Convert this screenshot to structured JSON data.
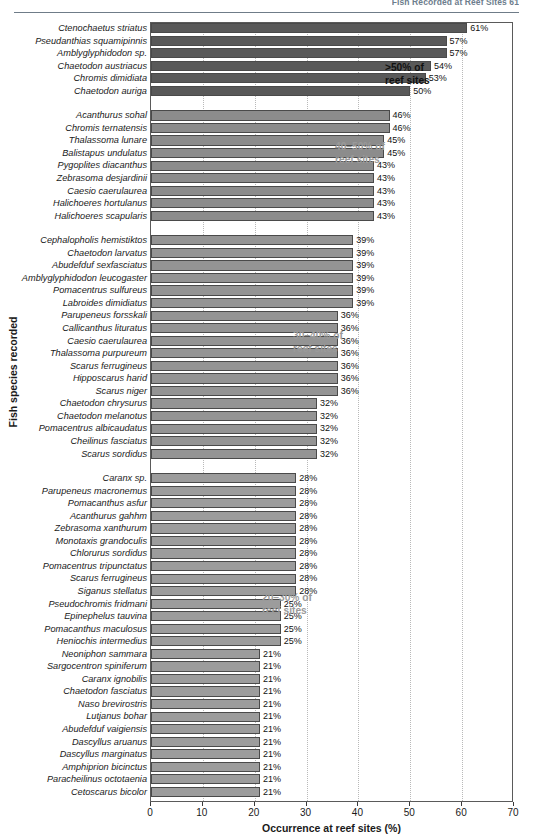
{
  "page": {
    "running_head": "Fish Recorded at Reef Sites   61"
  },
  "chart_data": {
    "type": "bar",
    "orientation": "horizontal",
    "title": "",
    "xlabel": "Occurrence at reef sites (%)",
    "ylabel": "Fish species recorded",
    "xlim": [
      0,
      70
    ],
    "xticks": [
      0,
      10,
      20,
      30,
      40,
      50,
      60,
      70
    ],
    "grid": "vertical-dotted",
    "legend": "none",
    "value_suffix": "%",
    "groups": [
      {
        "note": ">50% of\nreef sites",
        "note_line1": ">50% of",
        "note_line2": "reef sites",
        "note_color": "#111111",
        "bar_color": "#595959",
        "categories": [
          "Ctenochaetus striatus",
          "Pseudanthias squamipinnis",
          "Amblyglyphidodon sp.",
          "Chaetodon austriacus",
          "Chromis dimidiata",
          "Chaetodon auriga"
        ],
        "values": [
          61,
          57,
          57,
          54,
          53,
          50
        ]
      },
      {
        "note_line1": "40–50% of",
        "note_line2": "reef sites",
        "note_color": "#9a9a9a",
        "bar_color": "#8c8c8c",
        "categories": [
          "Acanthurus sohal",
          "Chromis ternatensis",
          "Thalassoma lunare",
          "Balistapus undulatus",
          "Pygoplites diacanthus",
          "Zebrasoma desjardinii",
          "Caesio caerulaurea",
          "Halichoeres hortulanus",
          "Halichoeres scapularis"
        ],
        "values": [
          46,
          46,
          45,
          45,
          43,
          43,
          43,
          43,
          43
        ]
      },
      {
        "note_line1": "30–40% of",
        "note_line2": "reef sites",
        "note_color": "#9a9a9a",
        "bar_color": "#949494",
        "categories": [
          "Cephalopholis hemistiktos",
          "Chaetodon larvatus",
          "Abudefduf sexfasciatus",
          "Amblyglyphidodon leucogaster",
          "Pomacentrus sulfureus",
          "Labroides dimidiatus",
          "Parupeneus forsskali",
          "Callicanthus lituratus",
          "Caesio caerulaurea",
          "Thalassoma purpureum",
          "Scarus ferrugineus",
          "Hipposcarus harid",
          "Scarus niger",
          "Chaetodon chrysurus",
          "Chaetodon melanotus",
          "Pomacentrus albicaudatus",
          "Cheilinus fasciatus",
          "Scarus sordidus"
        ],
        "values": [
          39,
          39,
          39,
          39,
          39,
          39,
          36,
          36,
          36,
          36,
          36,
          36,
          36,
          32,
          32,
          32,
          32,
          32
        ]
      },
      {
        "note_line1": "20–30% of",
        "note_line2": "reef sites",
        "note_color": "#9a9a9a",
        "bar_color": "#9c9c9c",
        "categories": [
          "Caranx sp.",
          "Parupeneus macronemus",
          "Pomacanthus asfur",
          "Acanthurus gahhm",
          "Zebrasoma xanthurum",
          "Monotaxis grandoculis",
          "Chlorurus sordidus",
          "Pomacentrus tripunctatus",
          "Scarus ferrugineus",
          "Siganus stellatus",
          "Pseudochromis fridmani",
          "Epinephelus tauvina",
          "Pomacanthus maculosus",
          "Heniochis intermedius",
          "Neoniphon sammara",
          "Sargocentron spiniferum",
          "Caranx ignobilis",
          "Chaetodon fasciatus",
          "Naso brevirostris",
          "Lutjanus bohar",
          "Abudefduf vaigiensis",
          "Dascyllus aruanus",
          "Dascyllus marginatus",
          "Amphiprion bicinctus",
          "Paracheilinus octotaenia",
          "Cetoscarus bicolor"
        ],
        "values": [
          28,
          28,
          28,
          28,
          28,
          28,
          28,
          28,
          28,
          28,
          25,
          25,
          25,
          25,
          21,
          21,
          21,
          21,
          21,
          21,
          21,
          21,
          21,
          21,
          21,
          21
        ]
      }
    ]
  }
}
